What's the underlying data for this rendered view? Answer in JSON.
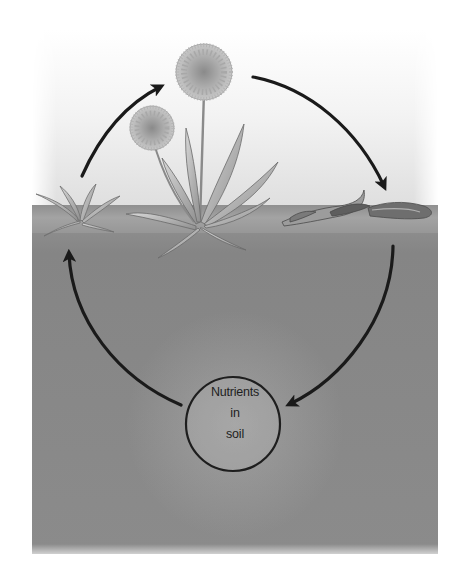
{
  "diagram": {
    "type": "nutrient cycle",
    "stages": [
      {
        "id": "young-plant",
        "description": "young dandelion rosette at left"
      },
      {
        "id": "flowering-plant",
        "description": "mature flowering dandelion at center"
      },
      {
        "id": "decaying-plant",
        "description": "dead, decomposing plant at right"
      },
      {
        "id": "soil-nutrients",
        "description": "circle in soil labeled Nutrients in soil"
      }
    ],
    "arrows": [
      {
        "from": "young-plant",
        "to": "flowering-plant"
      },
      {
        "from": "flowering-plant",
        "to": "decaying-plant"
      },
      {
        "from": "decaying-plant",
        "to": "soil-nutrients"
      },
      {
        "from": "soil-nutrients",
        "to": "young-plant"
      }
    ],
    "center_label": {
      "line1": "Nutrients",
      "line2": "in",
      "line3": "soil"
    }
  },
  "colors": {
    "arrow": "#1a1a1a",
    "soil": "#8a8a8a",
    "sky": "#f0f0f0",
    "circle_stroke": "#1e1e1e"
  }
}
